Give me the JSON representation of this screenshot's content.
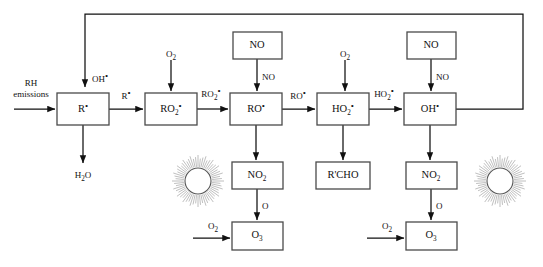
{
  "diagram": {
    "type": "flow-diagram",
    "boxes": [
      {
        "id": "r-radical",
        "label": "R•",
        "base": "R",
        "sub": "",
        "dot": true,
        "x": 57,
        "y": 93,
        "w": 52,
        "h": 32
      },
      {
        "id": "ro2-radical",
        "label": "RO2•",
        "base": "RO",
        "sub": "2",
        "dot": true,
        "x": 145,
        "y": 93,
        "w": 52,
        "h": 32
      },
      {
        "id": "ro-radical",
        "label": "RO•",
        "base": "RO",
        "sub": "",
        "dot": true,
        "x": 230,
        "y": 93,
        "w": 52,
        "h": 32
      },
      {
        "id": "ho2-radical",
        "label": "HO2•",
        "base": "HO",
        "sub": "2",
        "dot": true,
        "x": 317,
        "y": 93,
        "w": 52,
        "h": 32
      },
      {
        "id": "oh-radical",
        "label": "OH•",
        "base": "OH",
        "sub": "",
        "dot": true,
        "x": 404,
        "y": 93,
        "w": 52,
        "h": 32
      },
      {
        "id": "no-source-left",
        "label": "NO",
        "base": "NO",
        "sub": "",
        "dot": false,
        "x": 233,
        "y": 32,
        "w": 49,
        "h": 27
      },
      {
        "id": "no-source-right",
        "label": "NO",
        "base": "NO",
        "sub": "",
        "dot": false,
        "x": 407,
        "y": 32,
        "w": 49,
        "h": 27
      },
      {
        "id": "no2-left",
        "label": "NO2",
        "base": "NO",
        "sub": "2",
        "dot": false,
        "x": 232,
        "y": 162,
        "w": 51,
        "h": 27
      },
      {
        "id": "no2-right",
        "label": "NO2",
        "base": "NO",
        "sub": "2",
        "dot": false,
        "x": 406,
        "y": 162,
        "w": 51,
        "h": 27
      },
      {
        "id": "rcho",
        "label": "R'CHO",
        "base": "R'CHO",
        "sub": "",
        "dot": false,
        "x": 316,
        "y": 162,
        "w": 54,
        "h": 27
      },
      {
        "id": "o3-left",
        "label": "O3",
        "base": "O",
        "sub": "3",
        "dot": false,
        "x": 232,
        "y": 222,
        "w": 51,
        "h": 28
      },
      {
        "id": "o3-right",
        "label": "O3",
        "base": "O",
        "sub": "3",
        "dot": false,
        "x": 406,
        "y": 222,
        "w": 51,
        "h": 28
      }
    ],
    "edge_labels": [
      {
        "id": "rh-emissions-line1",
        "text": "RH",
        "x": 31,
        "y": 86
      },
      {
        "id": "rh-emissions-line2",
        "text": "emissions",
        "x": 31,
        "y": 97
      },
      {
        "id": "oh-feedback",
        "base": "OH",
        "sub": "",
        "dot": true,
        "x": 92,
        "y": 82
      },
      {
        "id": "h2o-output",
        "base": "H",
        "sub": "2",
        "tail": "O",
        "dot": false,
        "x": 83,
        "y": 175
      },
      {
        "id": "r-to-ro2",
        "base": "R",
        "sub": "",
        "dot": true,
        "x": 127,
        "y": 99
      },
      {
        "id": "ro2-to-ro",
        "base": "RO",
        "sub": "2",
        "dot": true,
        "x": 213,
        "y": 97
      },
      {
        "id": "ro-to-ho2",
        "base": "RO",
        "sub": "",
        "dot": true,
        "x": 299,
        "y": 99
      },
      {
        "id": "ho2-to-oh",
        "base": "HO",
        "sub": "2",
        "dot": true,
        "x": 386,
        "y": 97
      },
      {
        "id": "o2-to-ro2",
        "base": "O",
        "sub": "2",
        "dot": false,
        "x": 171,
        "y": 54
      },
      {
        "id": "o2-to-ho2",
        "base": "O",
        "sub": "2",
        "dot": false,
        "x": 345,
        "y": 54
      },
      {
        "id": "no-left-arrow",
        "base": "NO",
        "sub": "",
        "dot": false,
        "x": 268,
        "y": 80
      },
      {
        "id": "no-right-arrow",
        "base": "NO",
        "sub": "",
        "dot": false,
        "x": 442,
        "y": 80
      },
      {
        "id": "o-left",
        "base": "O",
        "sub": "",
        "dot": false,
        "x": 267,
        "y": 209
      },
      {
        "id": "o-right",
        "base": "O",
        "sub": "",
        "dot": false,
        "x": 441,
        "y": 209
      },
      {
        "id": "o2-to-o3-left",
        "base": "O",
        "sub": "2",
        "dot": false,
        "x": 213,
        "y": 226
      },
      {
        "id": "o2-to-o3-right",
        "base": "O",
        "sub": "2",
        "dot": false,
        "x": 387,
        "y": 226
      }
    ],
    "suns": [
      {
        "id": "sun-left",
        "cx": 198,
        "cy": 181,
        "r": 13
      },
      {
        "id": "sun-right",
        "cx": 500,
        "cy": 181,
        "r": 13
      }
    ],
    "colors": {
      "box_stroke": "#4a4a4a",
      "line": "#111111",
      "background": "#ffffff",
      "sun_ray": "#8a8a8a"
    }
  }
}
